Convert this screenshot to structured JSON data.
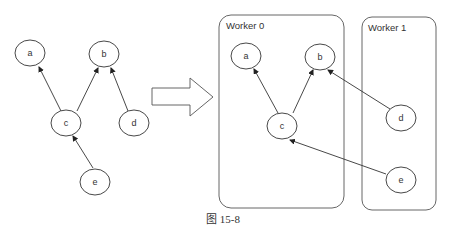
{
  "left_graph": {
    "nodes": {
      "a": "a",
      "b": "b",
      "c": "c",
      "d": "d",
      "e": "e"
    }
  },
  "right_graph": {
    "workers": {
      "worker0": "Worker 0",
      "worker1": "Worker 1"
    },
    "nodes": {
      "a": "a",
      "b": "b",
      "c": "c",
      "d": "d",
      "e": "e"
    }
  },
  "caption": "图 15-8",
  "colors": {
    "stroke": "#333333",
    "background": "#ffffff"
  }
}
